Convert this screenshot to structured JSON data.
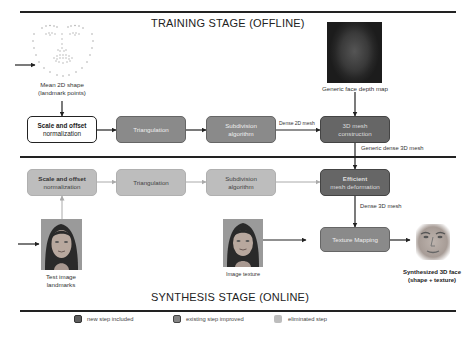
{
  "titles": {
    "training": "TRAINING STAGE (OFFLINE)",
    "synthesis": "SYNTHESIS STAGE (ONLINE)"
  },
  "training": {
    "mean_shape": {
      "caption_line1": "Mean 2D shape",
      "caption_line2": "(landmark points)",
      "icon": "landmark-points-face"
    },
    "depth_map": {
      "caption": "Generic face depth map",
      "icon": "depth-map-image"
    },
    "steps": [
      {
        "line1": "Scale and offset",
        "line2": "normalization",
        "type": "new_step_included_none"
      },
      {
        "line1": "Triangulation",
        "line2": "",
        "type": "existing_step_improved"
      },
      {
        "line1": "Subdivision",
        "line2": "algorithm",
        "type": "existing_step_improved"
      },
      {
        "line1": "3D mesh",
        "line2": "construction",
        "type": "new_step_included"
      }
    ],
    "edge_labels": {
      "dense_2d_mesh": "Dense 2D mesh",
      "generic_dense_3d_mesh": "Generic dense 3D mesh"
    }
  },
  "synthesis": {
    "steps": [
      {
        "line1": "Scale and offset",
        "line2": "normalization",
        "type": "eliminated_step"
      },
      {
        "line1": "Triangulation",
        "line2": "",
        "type": "eliminated_step"
      },
      {
        "line1": "Subdivision",
        "line2": "algorithm",
        "type": "eliminated_step"
      },
      {
        "line1": "Efficient",
        "line2": "mesh deformation",
        "type": "new_step_included"
      },
      {
        "line1": "Texture Mapping",
        "line2": "",
        "type": "existing_step_improved"
      }
    ],
    "edge_labels": {
      "dense_3d_mesh": "Dense 3D mesh"
    },
    "test_image": {
      "caption_line1": "Test image",
      "caption_line2": "landmarks",
      "icon": "face-photo"
    },
    "image_texture": {
      "caption": "Image texture",
      "icon": "face-photo"
    },
    "result": {
      "caption_line1": "Synthesized 3D face",
      "caption_line2": "(shape + texture)",
      "icon": "synthesized-face"
    }
  },
  "legend": [
    {
      "label": "new step included",
      "color": "#5e5e5e"
    },
    {
      "label": "existing step improved",
      "color": "#858585"
    },
    {
      "label": "eliminated step",
      "color": "#bdbdbd"
    }
  ],
  "colors": {
    "new_step": "#666666",
    "improved_step": "#8a8a8a",
    "eliminated_step": "#bdbdbd",
    "line": "#222222"
  }
}
